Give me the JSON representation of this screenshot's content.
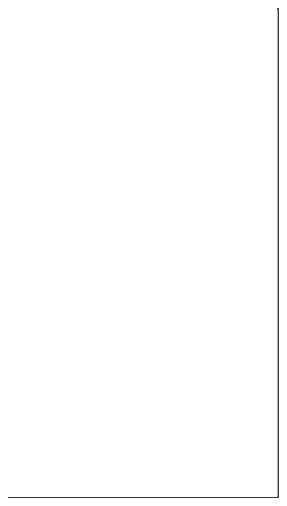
{
  "figure": {
    "caption": "Anterior view of a male human body silhouette with the lungs and trachea shaded",
    "frame": {
      "border_color": "#3a3a3a",
      "border_width_px": 1.4,
      "inset_px": 8,
      "background": "#ffffff"
    },
    "canvas": {
      "width": 287,
      "height": 506,
      "background": "#ffffff"
    }
  },
  "palette": {
    "page_background": "#ffffff",
    "frame_border": "#3a3a3a",
    "body_silhouette": "#e9e9e9",
    "body_torso": "#e2e2e2",
    "body_shadow": "#dedede",
    "lung_fill": "#7d7d7d",
    "lung_fill_left": "#797979",
    "lung_fill_right": "#7f7f7f",
    "trachea_fill": "#7d7d7d"
  },
  "body": {
    "name": "human-body-silhouette",
    "view": "anterior",
    "fill": "#e9e9e9",
    "parts": [
      {
        "id": "head",
        "label": "Head",
        "fill": "#e9e9e9"
      },
      {
        "id": "ear-left",
        "label": "Left ear",
        "fill": "#e4e4e4"
      },
      {
        "id": "ear-right",
        "label": "Right ear",
        "fill": "#e4e4e4"
      },
      {
        "id": "neck",
        "label": "Neck",
        "fill": "#e6e6e6"
      },
      {
        "id": "torso",
        "label": "Torso",
        "fill": "#e2e2e2"
      },
      {
        "id": "arm-left",
        "label": "Left arm",
        "fill": "#e9e9e9"
      },
      {
        "id": "arm-right",
        "label": "Right arm",
        "fill": "#e9e9e9"
      },
      {
        "id": "hand-left",
        "label": "Left hand",
        "fill": "#e9e9e9"
      },
      {
        "id": "hand-right",
        "label": "Right hand",
        "fill": "#e9e9e9"
      },
      {
        "id": "leg-left",
        "label": "Left leg",
        "fill": "#e9e9e9"
      },
      {
        "id": "leg-right",
        "label": "Right leg",
        "fill": "#e9e9e9"
      },
      {
        "id": "foot-left",
        "label": "Left foot",
        "fill": "#e9e9e9"
      },
      {
        "id": "foot-right",
        "label": "Right foot",
        "fill": "#e9e9e9"
      }
    ]
  },
  "organs": {
    "system": "respiratory",
    "highlighted": [
      {
        "id": "trachea",
        "label": "Trachea",
        "fill": "#7d7d7d"
      },
      {
        "id": "lung-left",
        "label": "Left lung",
        "fill": "#797979"
      },
      {
        "id": "lung-right",
        "label": "Right lung",
        "fill": "#7f7f7f"
      }
    ]
  }
}
